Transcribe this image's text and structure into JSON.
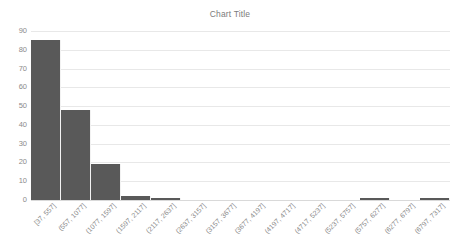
{
  "chart_data": {
    "type": "bar",
    "title": "Chart Title",
    "xlabel": "",
    "ylabel": "",
    "ylim": [
      0,
      90
    ],
    "ytick_step": 10,
    "yticks": [
      "90",
      "80",
      "70",
      "60",
      "50",
      "40",
      "30",
      "20",
      "10",
      "0"
    ],
    "grid": true,
    "legend": "none",
    "bar_color": "#595959",
    "gridline_color": "#e8e8e8",
    "tick_label_color": "#8a8a8a",
    "title_color": "#7b7b7b",
    "categories": [
      "[37, 557]",
      "(557, 1077]",
      "(1077, 1597]",
      "(1597, 2117]",
      "(2117, 2637]",
      "(2637, 3157]",
      "(3157, 3677]",
      "(3677, 4197]",
      "(4197, 4717]",
      "(4717, 5237]",
      "(5237, 5757]",
      "(5757, 6277]",
      "(6277, 6797]",
      "(6797, 7317]"
    ],
    "values": [
      85,
      48,
      19,
      2,
      1,
      0,
      0,
      0,
      0,
      0,
      0,
      1,
      0,
      1
    ]
  }
}
